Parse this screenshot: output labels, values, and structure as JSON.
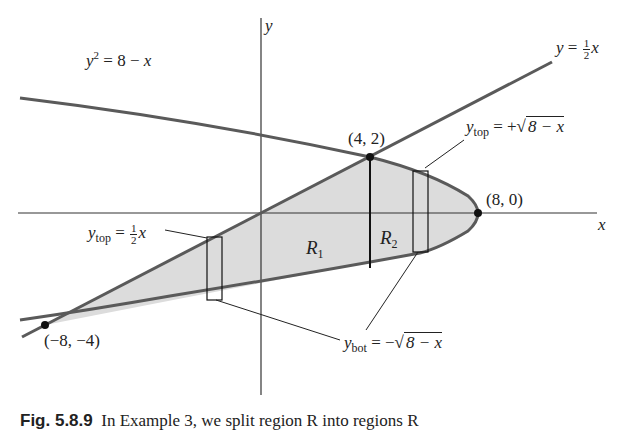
{
  "figure": {
    "axes": {
      "x_label": "x",
      "y_label": "y"
    },
    "curves": {
      "parabola_label": "y² = 8 − x",
      "line_label": "y = ½x"
    },
    "points": [
      {
        "label": "(4, 2)",
        "x": 4,
        "y": 2
      },
      {
        "label": "(8, 0)",
        "x": 8,
        "y": 0
      },
      {
        "label": "(−8, −4)",
        "x": -8,
        "y": -4
      }
    ],
    "regions": [
      {
        "label": "R",
        "sub": "1"
      },
      {
        "label": "R",
        "sub": "2"
      }
    ],
    "annotations": {
      "ytop_right": {
        "y": "y",
        "sub": "top",
        "eq": " = +",
        "sqrt": "8 − x"
      },
      "ytop_left": {
        "y": "y",
        "sub": "top",
        "eq": " = ",
        "num": "1",
        "den": "2",
        "x": "x"
      },
      "ybot": {
        "y": "y",
        "sub": "bot",
        "eq": " = −",
        "sqrt": "8 − x"
      }
    },
    "colors": {
      "curve": "#5a5a5a",
      "fill": "#dcdcdc",
      "axis": "#333333",
      "point": "#111111"
    }
  },
  "caption": {
    "label": "Fig. 5.8.9",
    "text": "In Example 3, we split region R into regions R"
  }
}
